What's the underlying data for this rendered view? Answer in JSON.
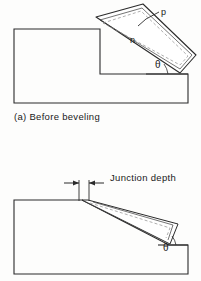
{
  "figure": {
    "caption_a": "(a) Before beveling",
    "labels": {
      "p_region": "p",
      "n_region": "n",
      "angle_top": "θ",
      "angle_bottom": "θ",
      "junction_depth": "Junction depth"
    },
    "colors": {
      "ink": "#1a1a1a",
      "line": "#2b2b2b",
      "dashed": "#8a8a8a",
      "background": "#fdfdfc"
    }
  }
}
